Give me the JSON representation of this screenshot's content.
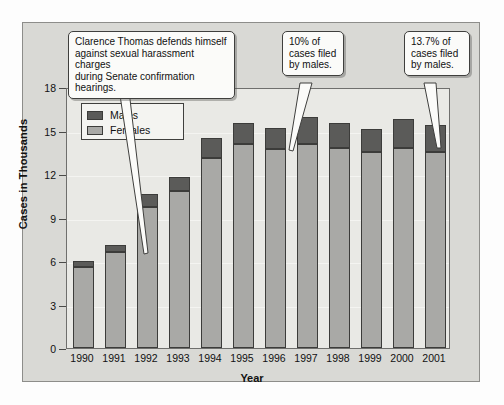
{
  "chart_data": {
    "type": "bar",
    "subtype": "stacked-vertical",
    "title": "",
    "xlabel": "Year",
    "ylabel": "Cases in Thousands",
    "categories": [
      "1990",
      "1991",
      "1992",
      "1993",
      "1994",
      "1995",
      "1996",
      "1997",
      "1998",
      "1999",
      "2000",
      "2001"
    ],
    "series": [
      {
        "name": "Females",
        "color": "#a9a9a6",
        "values": [
          5.6,
          6.6,
          9.7,
          10.8,
          13.1,
          14.1,
          13.7,
          14.1,
          13.8,
          13.5,
          13.8,
          13.5
        ]
      },
      {
        "name": "Males",
        "color": "#5b5b59",
        "values": [
          0.4,
          0.5,
          0.9,
          1.0,
          1.4,
          1.4,
          1.5,
          1.8,
          1.7,
          1.6,
          2.0,
          1.9
        ]
      }
    ],
    "totals": [
      6.0,
      7.1,
      10.6,
      11.8,
      14.5,
      15.5,
      15.2,
      15.9,
      15.5,
      15.1,
      15.8,
      15.4
    ],
    "ylim": [
      0,
      18
    ],
    "yticks": [
      0,
      3,
      6,
      9,
      12,
      15,
      18
    ],
    "ytick_labels": [
      "0",
      "3",
      "6",
      "9",
      "12",
      "15",
      "18"
    ],
    "grid": true,
    "legend_position": "upper-left-inside",
    "stacking_order": [
      "Females",
      "Males"
    ]
  },
  "legend": {
    "items": [
      {
        "label": "Males",
        "color": "#5b5b59"
      },
      {
        "label": "Females",
        "color": "#a9a9a6"
      }
    ]
  },
  "annotations": [
    {
      "id": "callout-clarence-thomas",
      "text": "Clarence Thomas defends himself\nagainst sexual harassment charges\nduring Senate confirmation hearings.",
      "points_to": "1991"
    },
    {
      "id": "callout-1996-males",
      "text": "10% of\ncases filed\nby males.",
      "points_to": "1996"
    },
    {
      "id": "callout-2001-males",
      "text": "13.7% of\ncases filed\nby males.",
      "points_to": "2001"
    }
  ],
  "colors": {
    "male": "#5b5b59",
    "female": "#a9a9a6",
    "panel_background": "#d9d9d5",
    "plot_background": "#e9e9e5",
    "axis": "#4a4a48",
    "callout_background": "#fbfbf9"
  }
}
